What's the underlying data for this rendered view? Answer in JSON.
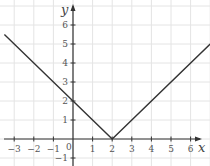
{
  "chart_data": {
    "type": "line",
    "title": "",
    "function": "y = |x - 2|",
    "xlabel": "x",
    "ylabel": "y",
    "xlim": [
      -3.7,
      7
    ],
    "ylim": [
      -1.3,
      7.1
    ],
    "grid": true,
    "x_ticks": [
      -3,
      -2,
      -1,
      0,
      1,
      2,
      3,
      4,
      5,
      6
    ],
    "x_tick_labels": [
      "−3",
      "−2",
      "−1",
      "0",
      "1",
      "2",
      "3",
      "4",
      "5",
      "6"
    ],
    "y_ticks": [
      -1,
      1,
      2,
      3,
      4,
      5,
      6
    ],
    "y_tick_labels": [
      "−1",
      "1",
      "2",
      "3",
      "4",
      "5",
      "6"
    ],
    "series": [
      {
        "name": "y = |x − 2|",
        "x": [
          -3.5,
          2,
          7
        ],
        "y": [
          5.5,
          0,
          5
        ],
        "color": "#333333"
      }
    ],
    "annotations": {
      "vertex": [
        2,
        0
      ],
      "y_intercept": [
        0,
        2
      ]
    }
  },
  "labels": {
    "x_axis": "x",
    "y_axis": "y",
    "origin": "0"
  }
}
